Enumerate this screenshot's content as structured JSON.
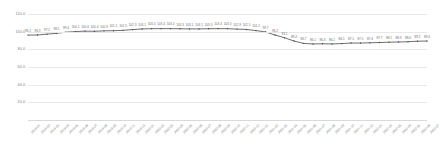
{
  "chart_data": {
    "type": "line",
    "title": "",
    "subtitle": "",
    "xlabel": "",
    "ylabel": "",
    "ylim": [
      0,
      120
    ],
    "grid": true,
    "legend": false,
    "legend_position": "none",
    "line_color": "#4a4a4a",
    "marker": "dot",
    "ytick_labels": [
      "120.0",
      "100.0",
      "80.0",
      "60.0",
      "40.0",
      "20.0"
    ],
    "ytick_values": [
      120,
      100,
      80,
      60,
      40,
      20
    ],
    "categories": [
      "2019-01",
      "2019-02",
      "2019-03",
      "2019-04",
      "2019-05",
      "2019-06",
      "2019-07",
      "2019-08",
      "2019-09",
      "2019-10",
      "2019-11",
      "2019-12",
      "2020-01",
      "2020-02",
      "2020-03",
      "2020-04",
      "2020-05",
      "2020-06",
      "2020-07",
      "2020-08",
      "2020-09",
      "2020-10",
      "2020-11",
      "2020-12",
      "2021-01",
      "2021-02",
      "2021-03",
      "2021-04",
      "2021-05",
      "2021-06",
      "2021-07",
      "2021-08",
      "2021-09",
      "2021-10",
      "2021-11",
      "2021-12",
      "2022-01",
      "2022-02",
      "2022-03",
      "2022-04",
      "2022-05",
      "2022-06",
      "2022-07"
    ],
    "values": [
      96.1,
      96.3,
      97.2,
      98.1,
      99.4,
      100.1,
      100.6,
      100.4,
      100.9,
      101.1,
      101.5,
      102.3,
      103.1,
      103.4,
      103.4,
      103.4,
      103.3,
      103.1,
      103.1,
      103.3,
      103.4,
      103.4,
      102.9,
      102.5,
      101.2,
      99.7,
      96.2,
      93.1,
      89.4,
      86.7,
      86.1,
      86.3,
      86.1,
      86.5,
      87.1,
      87.1,
      87.4,
      87.7,
      88.1,
      88.3,
      88.6,
      89.2,
      89.4
    ],
    "point_labels": [
      "96.1",
      "96.3",
      "97.2",
      "98.1",
      "99.4",
      "100.1",
      "100.6",
      "100.4",
      "100.9",
      "101.1",
      "101.5",
      "102.3",
      "103.1",
      "103.4",
      "103.4",
      "103.4",
      "103.3",
      "103.1",
      "103.1",
      "103.3",
      "103.4",
      "103.4",
      "102.9",
      "102.5",
      "101.2",
      "99.7",
      "96.2",
      "93.1",
      "89.4",
      "86.7",
      "86.1",
      "86.3",
      "86.1",
      "86.5",
      "87.1",
      "87.1",
      "87.4",
      "87.7",
      "88.1",
      "88.3",
      "88.6",
      "89.2",
      "89.4"
    ]
  }
}
